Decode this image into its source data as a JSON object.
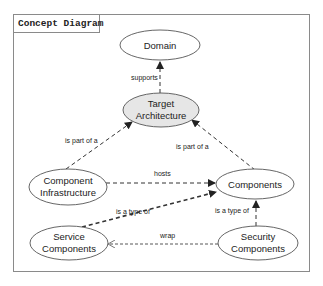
{
  "title": "Concept Diagram",
  "colors": {
    "frame": "#8a8a8a",
    "node_stroke": "#555555",
    "node_fill": "#ffffff",
    "highlight_fill": "#e6e6e6",
    "edge": "#333333",
    "text": "#222222"
  },
  "nodes": {
    "domain": {
      "lines": [
        "Domain"
      ]
    },
    "target_architecture": {
      "lines": [
        "Target",
        "Architecture"
      ]
    },
    "component_infrastructure": {
      "lines": [
        "Component",
        "Infrastructure"
      ]
    },
    "components": {
      "lines": [
        "Components"
      ]
    },
    "service_components": {
      "lines": [
        "Service",
        "Components"
      ]
    },
    "security_components": {
      "lines": [
        "Security",
        "Components"
      ]
    }
  },
  "edges": {
    "supports": {
      "from": "Target Architecture",
      "to": "Domain",
      "label": "supports"
    },
    "infra_part_of": {
      "from": "Component Infrastructure",
      "to": "Target Architecture",
      "label": "is part of a"
    },
    "components_part_of": {
      "from": "Components",
      "to": "Target Architecture",
      "label": "is part of a"
    },
    "hosts": {
      "from": "Component Infrastructure",
      "to": "Components",
      "label": "hosts"
    },
    "service_type_of": {
      "from": "Service Components",
      "to": "Components",
      "label": "is a type of"
    },
    "security_type_of": {
      "from": "Security Components",
      "to": "Components",
      "label": "is a type of"
    },
    "wrap": {
      "from": "Security Components",
      "to": "Service Components",
      "label": "wrap"
    }
  }
}
